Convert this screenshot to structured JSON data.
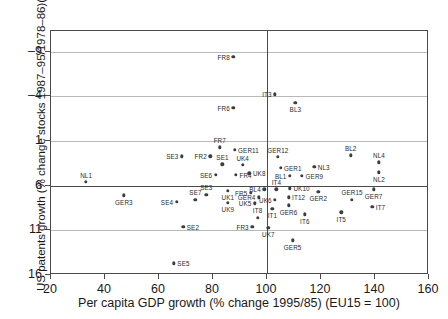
{
  "chart_data": {
    "type": "scatter",
    "title": "",
    "xlabel": "Per capita GDP growth (% change 1995/85) (EU15 = 100)",
    "ylabel": "US patents growth (% change stocks 1987–95/1978–86)(EU7 = 1)",
    "xlim": [
      20,
      160
    ],
    "ylim": [
      -9,
      18.3
    ],
    "xticks": [
      20,
      40,
      60,
      80,
      100,
      120,
      140,
      160
    ],
    "yticks": [
      -9,
      -4,
      1,
      6,
      11,
      16
    ],
    "grid": true,
    "gridlines_y": [
      16,
      11,
      6,
      1,
      -4
    ],
    "reference_lines": {
      "x": 100,
      "y": 1
    },
    "legend": "none",
    "marker": "filled-circle",
    "points": [
      {
        "label": "FR8",
        "x": 87.5,
        "y": 15.4,
        "lp": "left"
      },
      {
        "label": "FR6",
        "x": 87.5,
        "y": 9.7,
        "lp": "left"
      },
      {
        "label": "IT3",
        "x": 103.0,
        "y": 11.2,
        "lp": "left"
      },
      {
        "label": "BL3",
        "x": 110.5,
        "y": 10.3,
        "lp": "below"
      },
      {
        "label": "FR7",
        "x": 82.5,
        "y": 5.3,
        "lp": "above"
      },
      {
        "label": "GER11",
        "x": 88.0,
        "y": 5.0,
        "lp": "right"
      },
      {
        "label": "SE3",
        "x": 68.5,
        "y": 4.3,
        "lp": "left"
      },
      {
        "label": "FR2",
        "x": 79.0,
        "y": 4.3,
        "lp": "left"
      },
      {
        "label": "SE1",
        "x": 83.5,
        "y": 3.4,
        "lp": "above"
      },
      {
        "label": "UK4",
        "x": 91.0,
        "y": 3.3,
        "lp": "above"
      },
      {
        "label": "SE6",
        "x": 81.0,
        "y": 2.2,
        "lp": "left"
      },
      {
        "label": "FR4",
        "x": 88.5,
        "y": 2.2,
        "lp": "right"
      },
      {
        "label": "UK8",
        "x": 93.5,
        "y": 2.4,
        "lp": "right"
      },
      {
        "label": "GER12",
        "x": 104.0,
        "y": 4.2,
        "lp": "above"
      },
      {
        "label": "GER1",
        "x": 105.0,
        "y": 3.0,
        "lp": "right"
      },
      {
        "label": "NL3",
        "x": 117.5,
        "y": 3.1,
        "lp": "right"
      },
      {
        "label": "BL1",
        "x": 108.5,
        "y": 2.1,
        "lp": "left"
      },
      {
        "label": "GER9",
        "x": 113.0,
        "y": 2.1,
        "lp": "right"
      },
      {
        "label": "BL2",
        "x": 131.0,
        "y": 4.4,
        "lp": "above"
      },
      {
        "label": "NL4",
        "x": 141.5,
        "y": 3.6,
        "lp": "above"
      },
      {
        "label": "NL2",
        "x": 141.5,
        "y": 2.5,
        "lp": "below"
      },
      {
        "label": "NL1",
        "x": 33.0,
        "y": 1.4,
        "lp": "above"
      },
      {
        "label": "GER3",
        "x": 47.0,
        "y": -0.1,
        "lp": "below"
      },
      {
        "label": "SE3b",
        "x": 77.5,
        "y": 0.0,
        "lp": "above"
      },
      {
        "label": "UK1",
        "x": 85.5,
        "y": 0.4,
        "lp": "below"
      },
      {
        "label": "SE4",
        "x": 66.5,
        "y": -0.8,
        "lp": "left"
      },
      {
        "label": "SE7",
        "x": 73.5,
        "y": -0.6,
        "lp": "above"
      },
      {
        "label": "UK9",
        "x": 85.5,
        "y": -0.9,
        "lp": "below"
      },
      {
        "label": "FR5",
        "x": 94.0,
        "y": 0.2,
        "lp": "left"
      },
      {
        "label": "GER4",
        "x": 97.0,
        "y": -0.3,
        "lp": "left"
      },
      {
        "label": "UK5",
        "x": 95.5,
        "y": -1.0,
        "lp": "left"
      },
      {
        "label": "BL4",
        "x": 99.0,
        "y": 0.6,
        "lp": "left"
      },
      {
        "label": "IT4",
        "x": 103.5,
        "y": 0.6,
        "lp": "above"
      },
      {
        "label": "UK10",
        "x": 108.5,
        "y": 0.7,
        "lp": "right"
      },
      {
        "label": "IT12",
        "x": 108.0,
        "y": -0.3,
        "lp": "right"
      },
      {
        "label": "UK6",
        "x": 103.0,
        "y": -0.6,
        "lp": "left"
      },
      {
        "label": "GER6",
        "x": 108.0,
        "y": -1.2,
        "lp": "below"
      },
      {
        "label": "IT1",
        "x": 102.0,
        "y": -1.6,
        "lp": "below"
      },
      {
        "label": "GER2",
        "x": 119.0,
        "y": 0.3,
        "lp": "below"
      },
      {
        "label": "GER15",
        "x": 131.5,
        "y": -0.6,
        "lp": "above"
      },
      {
        "label": "GER7",
        "x": 139.5,
        "y": 0.6,
        "lp": "below"
      },
      {
        "label": "IT7",
        "x": 139.0,
        "y": -1.4,
        "lp": "right"
      },
      {
        "label": "IT5",
        "x": 127.5,
        "y": -2.0,
        "lp": "below"
      },
      {
        "label": "IT6",
        "x": 114.0,
        "y": -2.2,
        "lp": "below"
      },
      {
        "label": "IT8",
        "x": 96.5,
        "y": -2.6,
        "lp": "above"
      },
      {
        "label": "FR3",
        "x": 94.5,
        "y": -3.6,
        "lp": "left"
      },
      {
        "label": "UK7",
        "x": 100.5,
        "y": -3.7,
        "lp": "below"
      },
      {
        "label": "SE2",
        "x": 69.0,
        "y": -3.6,
        "lp": "right"
      },
      {
        "label": "GER5",
        "x": 109.5,
        "y": -5.1,
        "lp": "below"
      },
      {
        "label": "SE5",
        "x": 65.5,
        "y": -7.7,
        "lp": "right"
      }
    ]
  },
  "axes": {
    "x_tick_labels": [
      "20",
      "40",
      "60",
      "80",
      "100",
      "120",
      "140",
      "160"
    ],
    "y_tick_labels": [
      "16",
      "11",
      "6",
      "1",
      "–4",
      "–9"
    ],
    "x_title": "Per capita GDP growth (% change 1995/85) (EU15 = 100)",
    "y_title": "US patents growth (% change stocks 1987–95/1978–86)(EU7 = 1)"
  }
}
